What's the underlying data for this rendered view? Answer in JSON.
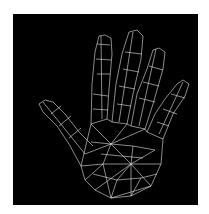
{
  "image": {
    "subject": "wireframe-hand",
    "background_color": "#000000",
    "frame_color": "#ffffff",
    "wire_color": "#e8e8e8"
  }
}
